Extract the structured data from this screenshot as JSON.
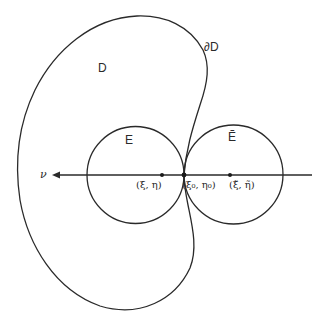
{
  "figure": {
    "region_label": "D",
    "boundary_label": "∂D",
    "inner_disk_label": "E",
    "outer_disk_label": "Ẽ",
    "normal_label": "ν",
    "points": {
      "center_E": "(ξ, η)",
      "tangent_point": "(ξ₀, η₀)",
      "center_E_tilde": "(ξ̃, η̃)"
    },
    "colors": {
      "stroke": "#2a2a2a",
      "background": "#ffffff"
    }
  }
}
